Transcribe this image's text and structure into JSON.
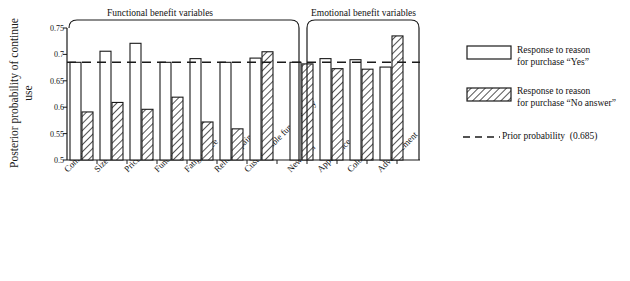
{
  "chart_data": {
    "type": "bar",
    "title": "",
    "xlabel": "",
    "ylabel": "Posterior probability of continue use",
    "ylim": [
      0.5,
      0.75
    ],
    "ytick_labels": [
      "0.75",
      "0.7",
      "0.65",
      "0.6",
      "0.55",
      "0.5"
    ],
    "ytick_values": [
      0.75,
      0.7,
      0.65,
      0.6,
      0.55,
      0.5
    ],
    "grid": false,
    "legend_position": "right",
    "categories": [
      "Comfort",
      "Size",
      "Price",
      "Function",
      "Fatigue free",
      "Relief of pain",
      "Customizable functionality",
      "New item",
      "Appearance",
      "Color",
      "Advertisement"
    ],
    "series": [
      {
        "name": "Response to reason for purchase \"Yes\"",
        "fill": "open",
        "values": [
          0.685,
          0.706,
          0.721,
          0.685,
          0.692,
          0.685,
          0.693,
          0.685,
          0.692,
          0.69,
          0.676
        ]
      },
      {
        "name": "Response to reason for purchase \"No answer\"",
        "fill": "hatched",
        "values": [
          0.591,
          0.609,
          0.596,
          0.619,
          0.572,
          0.559,
          0.705,
          0.682,
          0.673,
          0.672,
          0.735
        ]
      }
    ],
    "reference_line": {
      "label": "Prior probability (0.685)",
      "value": 0.685,
      "style": "dashed"
    },
    "groups": [
      {
        "label": "Functional benefit variables",
        "categories": [
          "Comfort",
          "Size",
          "Price",
          "Function",
          "Fatigue free",
          "Relief of pain",
          "Customizable functionality"
        ]
      },
      {
        "label": "Emotional benefit variables",
        "categories": [
          "New item",
          "Appearance",
          "Color",
          "Advertisement"
        ]
      }
    ]
  },
  "legend": {
    "items": [
      {
        "swatch": "open-bar-swatch",
        "line1": "Response to reason",
        "line2": "for purchase “Yes”"
      },
      {
        "swatch": "hatched-bar-swatch",
        "line1": "Response to reason",
        "line2": "for purchase “No answer”"
      },
      {
        "swatch": "dashed-line-swatch",
        "line1": "Prior probability (0.685)",
        "line2": ""
      }
    ]
  },
  "colors": {
    "axis": "#1a1a1a",
    "bar_stroke": "#1a1a1a",
    "bar_fill": "#ffffff",
    "hatch": "#1a1a1a",
    "reference_line": "#1a1a1a",
    "background": "#ffffff"
  },
  "x_labels_short": {
    "l0": "Comfort",
    "l1": "Size",
    "l2": "Price",
    "l3": "Function",
    "l4": "Fatigue free",
    "l5": "Relief of pain",
    "l6": "Customizable functionality",
    "l7": "New item",
    "l8": "Appearance",
    "l9": "Color",
    "l10": "Advertisement"
  },
  "y_ticks": {
    "t0": "0.75",
    "t1": "0.7",
    "t2": "0.65",
    "t3": "0.6",
    "t4": "0.55",
    "t5": "0.5"
  },
  "groups_text": {
    "g0": "Functional benefit variables",
    "g1": "Emotional benefit variables"
  }
}
